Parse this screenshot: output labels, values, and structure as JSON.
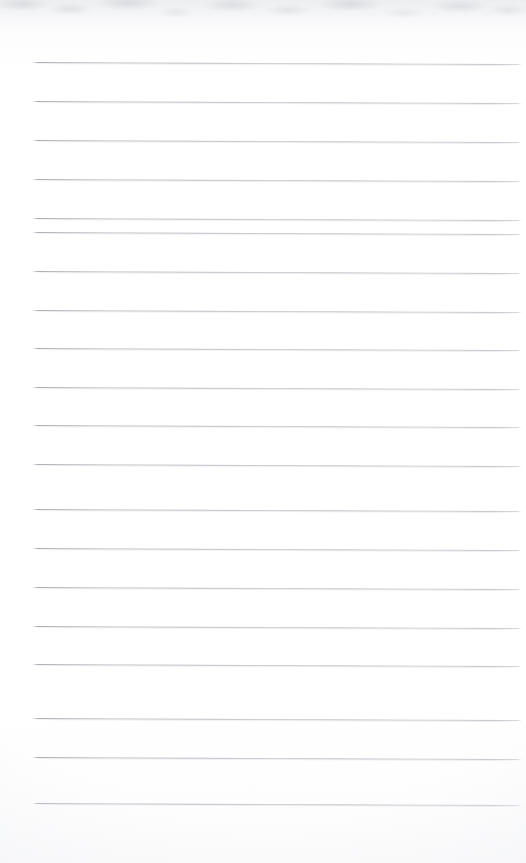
{
  "document": {
    "kind": "scanned-lined-notepad-page",
    "title": "Blank ruled notepad page",
    "page_width": 526,
    "page_height": 863,
    "orientation": "portrait",
    "has_text": false,
    "has_handwriting": false,
    "background_color": "#ffffff",
    "paper_tint": "#fcfcfd",
    "top_edge_shadow_color": "#c6c9cd",
    "rule_color": "#b2b6bc",
    "rule_count": 20,
    "rule_left_x": 32,
    "rule_right_x": 522,
    "rule_first_y": 62,
    "rule_spacing": 39,
    "rule_slope_px": 2,
    "rules": [
      {
        "index": 1,
        "y": 62,
        "x1": 32,
        "x2": 522,
        "slope": 2
      },
      {
        "index": 2,
        "y": 101,
        "x1": 32,
        "x2": 522,
        "slope": 2
      },
      {
        "index": 3,
        "y": 140,
        "x1": 32,
        "x2": 522,
        "slope": 2
      },
      {
        "index": 4,
        "y": 179,
        "x1": 32,
        "x2": 522,
        "slope": 2
      },
      {
        "index": 5,
        "y": 218,
        "x1": 32,
        "x2": 522,
        "slope": 2
      },
      {
        "index": 6,
        "y": 232,
        "x1": 32,
        "x2": 522,
        "slope": 2
      },
      {
        "index": 7,
        "y": 271,
        "x1": 32,
        "x2": 522,
        "slope": 2
      },
      {
        "index": 8,
        "y": 310,
        "x1": 32,
        "x2": 522,
        "slope": 2
      },
      {
        "index": 9,
        "y": 348,
        "x1": 32,
        "x2": 522,
        "slope": 2
      },
      {
        "index": 10,
        "y": 387,
        "x1": 32,
        "x2": 522,
        "slope": 2
      },
      {
        "index": 11,
        "y": 425,
        "x1": 32,
        "x2": 522,
        "slope": 2
      },
      {
        "index": 12,
        "y": 464,
        "x1": 32,
        "x2": 522,
        "slope": 2
      },
      {
        "index": 13,
        "y": 509,
        "x1": 32,
        "x2": 522,
        "slope": 2
      },
      {
        "index": 14,
        "y": 548,
        "x1": 32,
        "x2": 522,
        "slope": 2
      },
      {
        "index": 15,
        "y": 587,
        "x1": 32,
        "x2": 522,
        "slope": 2
      },
      {
        "index": 16,
        "y": 626,
        "x1": 32,
        "x2": 522,
        "slope": 2
      },
      {
        "index": 17,
        "y": 664,
        "x1": 32,
        "x2": 522,
        "slope": 2
      },
      {
        "index": 18,
        "y": 718,
        "x1": 32,
        "x2": 522,
        "slope": 2
      },
      {
        "index": 19,
        "y": 757,
        "x1": 32,
        "x2": 522,
        "slope": 2
      },
      {
        "index": 20,
        "y": 803,
        "x1": 32,
        "x2": 522,
        "slope": 2
      }
    ],
    "margins": {
      "top_blank_px": 62,
      "bottom_blank_px": 60,
      "left_blank_px": 32,
      "right_blank_px": 4
    },
    "artifacts": {
      "top_edge_smudge": true,
      "paper_grain": true,
      "edge_vignette": true
    }
  }
}
